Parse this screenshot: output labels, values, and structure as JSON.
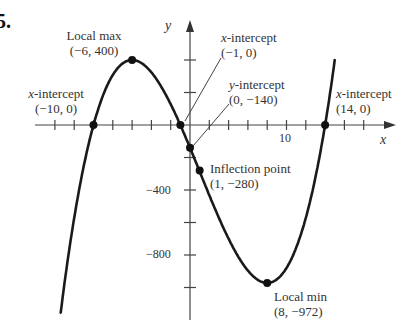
{
  "problem_number": "5.",
  "chart_data": {
    "type": "line",
    "title": "",
    "xlabel": "x",
    "ylabel": "y",
    "function_description": "cubic polynomial with intercepts at x = -10, -1, 14",
    "xlim": [
      -20,
      20
    ],
    "ylim": [
      -1200,
      600
    ],
    "grid": false,
    "x_tick_step": 2,
    "y_tick_step": 200,
    "x_tick_labels": [
      {
        "value": 10,
        "label": "10"
      }
    ],
    "y_tick_labels": [
      {
        "value": -400,
        "label": "-400"
      },
      {
        "value": -800,
        "label": "-800"
      }
    ],
    "series": [
      {
        "name": "f(x)",
        "points": [
          {
            "x": -10,
            "y": 0,
            "label": "x-intercept",
            "coord": "(-10, 0)"
          },
          {
            "x": -6,
            "y": 400,
            "label": "Local max",
            "coord": "(-6, 400)"
          },
          {
            "x": -1,
            "y": 0,
            "label": "x-intercept",
            "coord": "(-1, 0)"
          },
          {
            "x": 0,
            "y": -140,
            "label": "y-intercept",
            "coord": "(0, -140)"
          },
          {
            "x": 1,
            "y": -280,
            "label": "Inflection point",
            "coord": "(1, -280)"
          },
          {
            "x": 8,
            "y": -972,
            "label": "Local min",
            "coord": "(8, -972)"
          },
          {
            "x": 14,
            "y": 0,
            "label": "x-intercept",
            "coord": "(14, 0)"
          }
        ]
      }
    ]
  },
  "annotations": {
    "local_max": {
      "title": "Local max",
      "coord": "(−6, 400)"
    },
    "x_int_left": {
      "title_var": "x",
      "title_rest": "-intercept",
      "coord": "(−10, 0)"
    },
    "x_int_mid": {
      "title_var": "x",
      "title_rest": "-intercept",
      "coord": "(−1, 0)"
    },
    "y_int": {
      "title_var": "y",
      "title_rest": "-intercept",
      "coord": "(0, −140)"
    },
    "x_int_right": {
      "title_var": "x",
      "title_rest": "-intercept",
      "coord": "(14, 0)"
    },
    "inflection": {
      "title": "Inflection point",
      "coord": "(1, −280)"
    },
    "local_min": {
      "title": "Local min",
      "coord": "(8, −972)"
    }
  },
  "axes": {
    "x_label": "x",
    "y_label": "y",
    "x_tick_10": "10",
    "y_tick_m400": "−400",
    "y_tick_m800": "−800"
  }
}
